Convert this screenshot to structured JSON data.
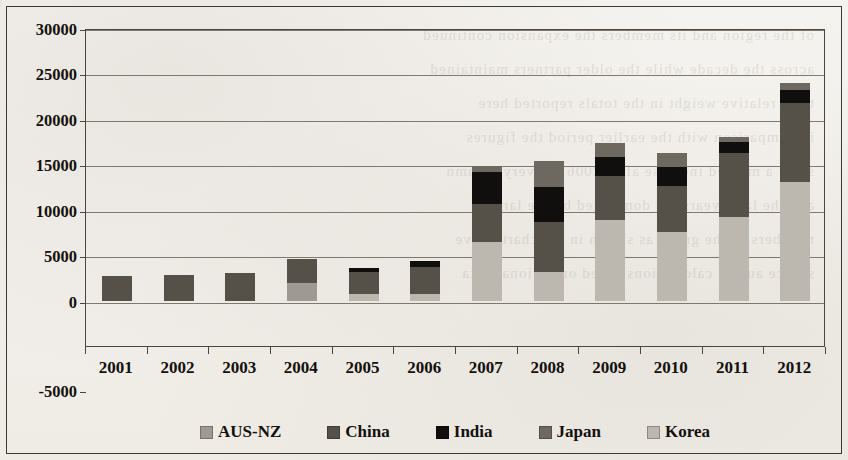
{
  "chart_data": {
    "type": "bar",
    "stacked": true,
    "title": "",
    "subtitle": "",
    "xlabel": "",
    "ylabel": "",
    "grid": true,
    "legend_position": "bottom",
    "ylim": [
      -5000,
      30000
    ],
    "ytick_labels": [
      "30000",
      "25000",
      "20000",
      "15000",
      "10000",
      "5000",
      "0",
      "-5000"
    ],
    "ytick_values": [
      30000,
      25000,
      20000,
      15000,
      10000,
      5000,
      0,
      -5000
    ],
    "categories": [
      "2001",
      "2002",
      "2003",
      "2004",
      "2005",
      "2006",
      "2007",
      "2008",
      "2009",
      "2010",
      "2011",
      "2012"
    ],
    "series": [
      {
        "name": "AUS-NZ",
        "color": "#9e9a93",
        "values": [
          0,
          0,
          0,
          1900,
          0,
          0,
          0,
          0,
          0,
          0,
          0,
          0
        ]
      },
      {
        "name": "China",
        "color": "#555149",
        "values": [
          2700,
          2850,
          3050,
          2700,
          2400,
          3000,
          4200,
          5400,
          4800,
          5100,
          7100,
          8700
        ]
      },
      {
        "name": "India",
        "color": "#100f0d",
        "values": [
          0,
          0,
          0,
          0,
          450,
          700,
          3500,
          3900,
          2100,
          2100,
          1200,
          1400
        ]
      },
      {
        "name": "Japan",
        "color": "#6e6960",
        "values": [
          0,
          0,
          0,
          0,
          0,
          0,
          700,
          2900,
          1500,
          1600,
          500,
          700
        ]
      },
      {
        "name": "Korea",
        "color": "#bcb8b0",
        "values": [
          0,
          0,
          0,
          0,
          700,
          700,
          6400,
          3200,
          8900,
          7500,
          9200,
          13100
        ]
      }
    ],
    "stack_order": [
      "AUS-NZ",
      "Korea",
      "China",
      "India",
      "Japan"
    ],
    "totals": [
      2700,
      2850,
      3050,
      4600,
      3550,
      4400,
      14800,
      15400,
      17300,
      16300,
      18000,
      23900
    ]
  },
  "legend": {
    "items": [
      {
        "label": "AUS-NZ",
        "color": "#9e9a93"
      },
      {
        "label": "China",
        "color": "#555149"
      },
      {
        "label": "India",
        "color": "#100f0d"
      },
      {
        "label": "Japan",
        "color": "#6e6960"
      },
      {
        "label": "Korea",
        "color": "#bcb8b0"
      }
    ]
  },
  "page": {
    "bleed_text": "of the region and its members the expansion continued\nacross the decade while the older partners maintained\ntheir relative weight in the totals reported here\nin comparison with the earlier period the figures\nshow a marked increase after 2006 in every column\nand the later years are dominated by the larger\nmembers of the group as shown in the chart above\nsource author calculations based on national data"
  }
}
